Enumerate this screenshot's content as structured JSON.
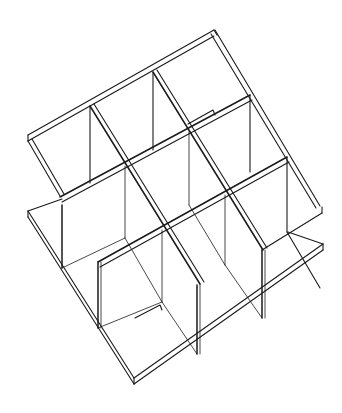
{
  "figure": {
    "grid_rows": 3,
    "grid_columns": 3,
    "line_color": "#1a1a1a",
    "background_color": "#ffffff"
  }
}
